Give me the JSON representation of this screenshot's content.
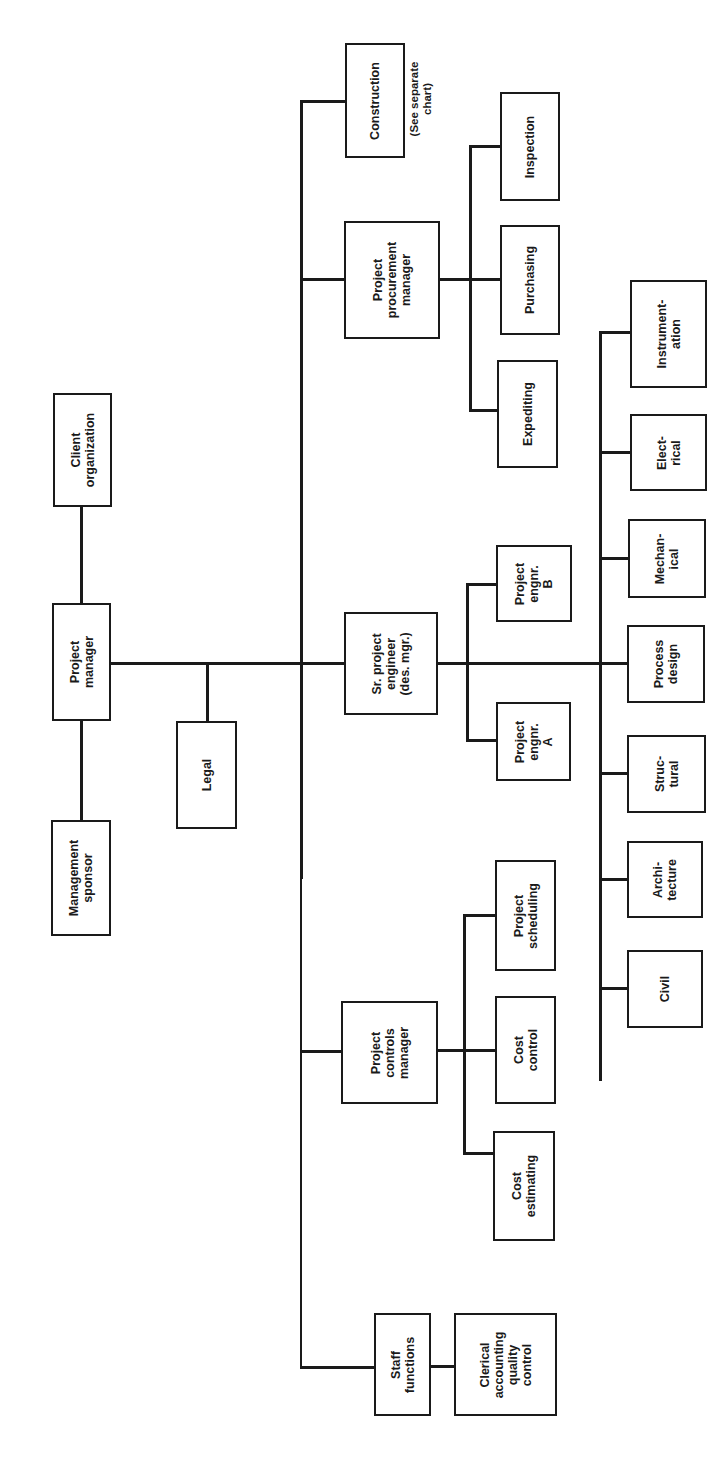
{
  "chart": {
    "type": "organization-chart",
    "orientation": "rotated-90-ccw",
    "nodes": {
      "client_organization": "Client\norganization",
      "project_manager": "Project\nmanager",
      "management_sponsor": "Management\nsponsor",
      "legal": "Legal",
      "construction": "Construction",
      "construction_note": "(See separate\nchart)",
      "procurement_manager": "Project\nprocurement\nmanager",
      "inspection": "Inspection",
      "purchasing": "Purchasing",
      "expediting": "Expediting",
      "sr_project_engineer": "Sr. project\nengineer\n(des. mgr.)",
      "project_engineer_b": "Project\nengnr.\nB",
      "project_engineer_a": "Project\nengnr.\nA",
      "instrumentation": "Instrument-\nation",
      "electrical": "Elect-\nrical",
      "mechanical": "Mechan-\nical",
      "process_design": "Process\ndesign",
      "structural": "Struc-\ntural",
      "architecture": "Archi-\ntecture",
      "civil": "Civil",
      "controls_manager": "Project\ncontrols\nmanager",
      "project_scheduling": "Project\nscheduling",
      "cost_control": "Cost\ncontrol",
      "cost_estimating": "Cost\nestimating",
      "staff_functions": "Staff\nfunctions",
      "clerical": "Clerical\naccounting\nquality\ncontrol"
    },
    "hierarchy": [
      {
        "parent": "Project manager",
        "children": [
          "Client organization",
          "Management sponsor",
          "Legal",
          "Construction",
          "Project procurement manager",
          "Sr. project engineer (des. mgr.)",
          "Project controls manager",
          "Staff functions"
        ]
      },
      {
        "parent": "Project procurement manager",
        "children": [
          "Inspection",
          "Purchasing",
          "Expediting"
        ]
      },
      {
        "parent": "Sr. project engineer (des. mgr.)",
        "children": [
          "Project engnr. A",
          "Project engnr. B",
          "Instrumentation",
          "Electrical",
          "Mechanical",
          "Process design",
          "Structural",
          "Architecture",
          "Civil"
        ]
      },
      {
        "parent": "Project controls manager",
        "children": [
          "Project scheduling",
          "Cost control",
          "Cost estimating"
        ]
      },
      {
        "parent": "Staff functions",
        "children": [
          "Clerical accounting quality control"
        ]
      }
    ]
  }
}
